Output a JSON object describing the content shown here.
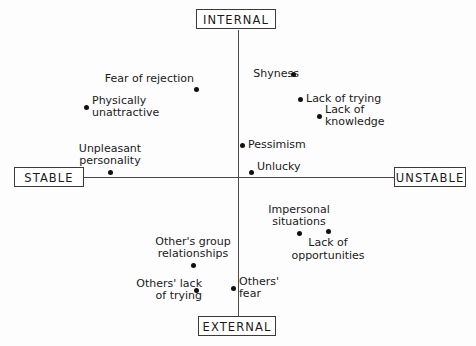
{
  "figure": {
    "title_present": false,
    "background_color": "#fdfdfd",
    "axis_color": "#4a4a4a",
    "dot_color": "#111111",
    "text_color": "#1a1a1a"
  },
  "poles": {
    "top": "INTERNAL",
    "bottom": "EXTERNAL",
    "left": "STABLE",
    "right": "UNSTABLE"
  },
  "chart_data": {
    "type": "scatter",
    "title": "",
    "xlabel": "",
    "ylabel": "",
    "xlim": [
      -1,
      1
    ],
    "ylim": [
      -1,
      1
    ],
    "grid": false,
    "legend": "none",
    "axis_labels": {
      "x_negative": "STABLE",
      "x_positive": "UNSTABLE",
      "y_positive": "INTERNAL",
      "y_negative": "EXTERNAL"
    },
    "points": [
      {
        "label": "Fear of rejection",
        "line1": "Fear of rejection",
        "line2": "",
        "x": -0.136,
        "y": 0.615,
        "px": 196,
        "py": 89,
        "label_pos": "above-left"
      },
      {
        "label": "Physically unattractive",
        "line1": "Physically",
        "line2": "unattractive",
        "x": -0.49,
        "y": 0.49,
        "px": 86,
        "py": 107,
        "label_pos": "right"
      },
      {
        "label": "Unpleasant personality",
        "line1": "Unpleasant",
        "line2": "personality",
        "x": -0.413,
        "y": 0.035,
        "px": 110,
        "py": 172,
        "label_pos": "above"
      },
      {
        "label": "Shyness",
        "line1": "Shyness",
        "line2": "",
        "x": 0.355,
        "y": 0.72,
        "px": 293,
        "py": 74,
        "label_pos": "left"
      },
      {
        "label": "Lack of trying",
        "line1": "Lack of trying",
        "line2": "",
        "x": 0.4,
        "y": 0.545,
        "px": 300,
        "py": 99,
        "label_pos": "right"
      },
      {
        "label": "Lack of knowledge",
        "line1": "Lack of",
        "line2": "knowledge",
        "x": 0.522,
        "y": 0.427,
        "px": 319,
        "py": 116,
        "label_pos": "right"
      },
      {
        "label": "Pessimism",
        "line1": "Pessimism",
        "line2": "",
        "x": 0.026,
        "y": 0.224,
        "px": 242,
        "py": 145,
        "label_pos": "right"
      },
      {
        "label": "Unlucky",
        "line1": "Unlucky",
        "line2": "",
        "x": 0.084,
        "y": 0.035,
        "px": 251,
        "py": 172,
        "label_pos": "right-above"
      },
      {
        "label": "Impersonal situations",
        "line1": "Impersonal",
        "line2": "situations",
        "x": 0.394,
        "y": -0.392,
        "px": 299,
        "py": 233,
        "label_pos": "above"
      },
      {
        "label": "Lack of opportunities",
        "line1": "Lack of",
        "line2": "opportunities",
        "x": 0.581,
        "y": -0.378,
        "px": 328,
        "py": 231,
        "label_pos": "below"
      },
      {
        "label": "Other's group relationships",
        "line1": "Other's group",
        "line2": "relationships",
        "x": -0.29,
        "y": -0.615,
        "px": 193,
        "py": 265,
        "label_pos": "above"
      },
      {
        "label": "Others' lack of trying",
        "line1": "Others' lack",
        "line2": "of trying",
        "x": -0.271,
        "y": -0.79,
        "px": 196,
        "py": 290,
        "label_pos": "left"
      },
      {
        "label": "Others' fear",
        "line1": "Others'",
        "line2": "fear",
        "x": -0.032,
        "y": -0.776,
        "px": 233,
        "py": 288,
        "label_pos": "right"
      }
    ]
  }
}
